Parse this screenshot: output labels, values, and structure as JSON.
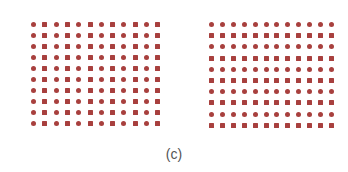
{
  "figure": {
    "caption": "(c)",
    "dot_color": "#a8403e",
    "panels": [
      {
        "name": "left-grid",
        "rows": 10,
        "cols": 12,
        "pattern": "alternating-columns",
        "shapes": [
          "circle",
          "square"
        ],
        "origin": [
          31,
          22
        ],
        "pitch_x": 11.3,
        "pitch_y": 11
      },
      {
        "name": "right-grid",
        "rows": 10,
        "cols": 12,
        "pattern": "alternating-rows",
        "shapes": [
          "circle",
          "square"
        ],
        "origin": [
          209,
          22
        ],
        "pitch_x": 10.9,
        "pitch_y": 11.2
      }
    ]
  }
}
